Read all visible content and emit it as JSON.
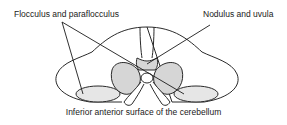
{
  "diagram": {
    "title": "Inferior anterior surface of the cerebellum",
    "labels": [
      {
        "id": "flocculus",
        "text": "Flocculus and paraflocculus"
      },
      {
        "id": "nodulus",
        "text": "Nodulus and uvula"
      }
    ],
    "colors": {
      "outline": "#2a2a2a",
      "fill_shaded": "#d6d6d6",
      "fill_light": "#e6e6e6",
      "background": "#ffffff"
    }
  }
}
